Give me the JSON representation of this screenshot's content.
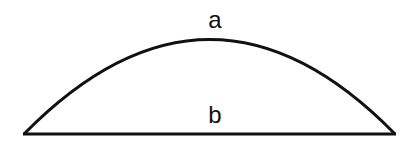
{
  "diagram": {
    "type": "circular-segment",
    "labels": {
      "arc": "a",
      "chord": "b"
    },
    "stroke_color": "#111111",
    "background": "#ffffff"
  }
}
